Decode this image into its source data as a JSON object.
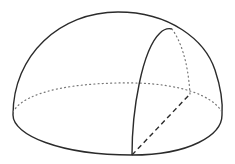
{
  "diagram": {
    "type": "geometric-solid",
    "subject": "hemisphere with a vertical cutting section",
    "colors": {
      "background": "#ffffff",
      "solid_line": "#2b2b2b",
      "dotted_line": "#777777",
      "dashed_line": "#2b2b2b"
    },
    "elements": [
      {
        "name": "dome-outline",
        "style": "solid"
      },
      {
        "name": "base-front-arc",
        "style": "solid"
      },
      {
        "name": "base-back-arc",
        "style": "dotted"
      },
      {
        "name": "section-arc",
        "style": "solid"
      },
      {
        "name": "hidden-vertical-edge",
        "style": "dotted"
      },
      {
        "name": "base-chord",
        "style": "dashed"
      }
    ],
    "labels": []
  }
}
